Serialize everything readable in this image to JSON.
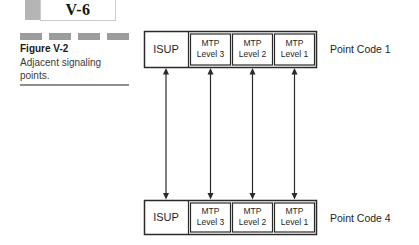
{
  "header": {
    "page_number": "V-6"
  },
  "caption": {
    "label": "Figure V-2",
    "line1": "Adjacent signaling",
    "line2": "points."
  },
  "diagram": {
    "stacks": [
      {
        "point_code": "Point Code 1",
        "isup_label": "ISUP",
        "layers": [
          [
            "MTP",
            "Level 3"
          ],
          [
            "MTP",
            "Level 2"
          ],
          [
            "MTP",
            "Level 1"
          ]
        ]
      },
      {
        "point_code": "Point Code 4",
        "isup_label": "ISUP",
        "layers": [
          [
            "MTP",
            "Level 3"
          ],
          [
            "MTP",
            "Level 2"
          ],
          [
            "MTP",
            "Level 1"
          ]
        ]
      }
    ],
    "link_count": 4
  },
  "colors": {
    "line": "#2a2a2a",
    "dash_gray": "#9c9c9c",
    "tab_marker_gray": "#b5b5b5",
    "rule_gray": "#8f8f8f"
  }
}
